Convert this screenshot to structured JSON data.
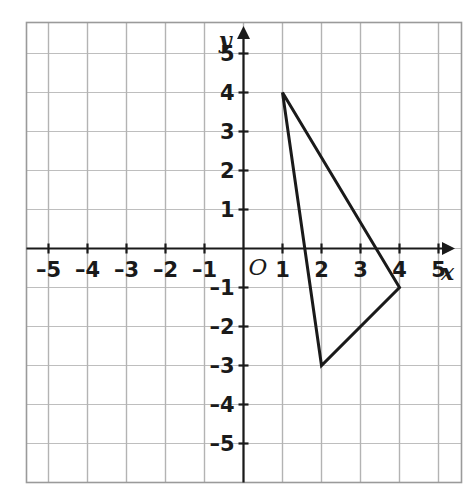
{
  "figure": {
    "background_color": "#ffffff",
    "ink_color": "#1a1a1a",
    "gridline_color": "#b3b3b3",
    "grid_border_color": "#9a9a9a"
  },
  "axes": {
    "x_axis_label": "x",
    "y_axis_label": "y",
    "origin_label": "O",
    "x_ticks": [
      {
        "value": -5,
        "label": "–5"
      },
      {
        "value": -4,
        "label": "–4"
      },
      {
        "value": -3,
        "label": "–3"
      },
      {
        "value": -2,
        "label": "–2"
      },
      {
        "value": -1,
        "label": "–1"
      },
      {
        "value": 1,
        "label": "1"
      },
      {
        "value": 2,
        "label": "2"
      },
      {
        "value": 3,
        "label": "3"
      },
      {
        "value": 4,
        "label": "4"
      },
      {
        "value": 5,
        "label": "5"
      }
    ],
    "y_ticks": [
      {
        "value": 5,
        "label": "5"
      },
      {
        "value": 4,
        "label": "4"
      },
      {
        "value": 3,
        "label": "3"
      },
      {
        "value": 2,
        "label": "2"
      },
      {
        "value": 1,
        "label": "1"
      },
      {
        "value": -1,
        "label": "–1"
      },
      {
        "value": -2,
        "label": "–2"
      },
      {
        "value": -3,
        "label": "–3"
      },
      {
        "value": -4,
        "label": "–4"
      },
      {
        "value": -5,
        "label": "–5"
      }
    ]
  },
  "chart_data": {
    "type": "scatter",
    "title": "",
    "xlabel": "x",
    "ylabel": "y",
    "xlim": [
      -5.6,
      5.45
    ],
    "ylim": [
      -5.8,
      5.8
    ],
    "grid": true,
    "legend": null,
    "xticks": [
      -5,
      -4,
      -3,
      -2,
      -1,
      1,
      2,
      3,
      4,
      5
    ],
    "yticks": [
      5,
      4,
      3,
      2,
      1,
      -1,
      -2,
      -3,
      -4,
      -5
    ],
    "series": [
      {
        "name": "triangle",
        "shape": "closed-polygon",
        "stroke_color": "#1a1a1a",
        "stroke_width": 3,
        "fill": "none",
        "vertices": [
          {
            "x": 1,
            "y": 4
          },
          {
            "x": 2,
            "y": -3
          },
          {
            "x": 4,
            "y": -1
          }
        ]
      }
    ]
  }
}
